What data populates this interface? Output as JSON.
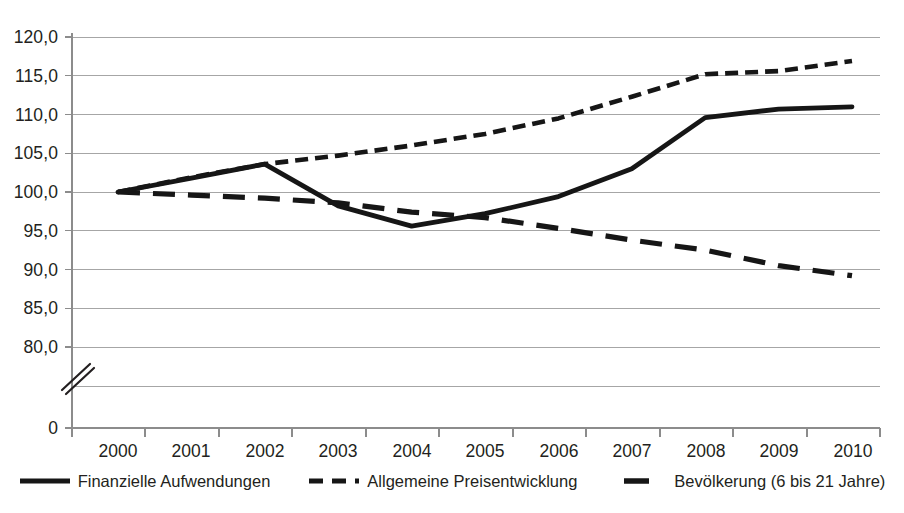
{
  "chart_data": {
    "type": "line",
    "title": "",
    "subtitle": "",
    "xlabel": "",
    "ylabel": "",
    "categories": [
      "2000",
      "2001",
      "2002",
      "2003",
      "2004",
      "2005",
      "2006",
      "2007",
      "2008",
      "2009",
      "2010"
    ],
    "ytick_labels": [
      "120,0",
      "115,0",
      "110,0",
      "105,0",
      "100,0",
      "95,0",
      "90,0",
      "85,0",
      "80,0",
      "0"
    ],
    "ytick_values": [
      120.0,
      115.0,
      110.0,
      105.0,
      100.0,
      95.0,
      90.0,
      85.0,
      80.0,
      0
    ],
    "ylim": [
      80.0,
      120.0
    ],
    "y_axis_break": true,
    "y_axis_break_symbol": "//",
    "grid": "horizontal",
    "legend_position": "bottom",
    "series": [
      {
        "name": "Finanzielle Aufwendungen",
        "style": "solid",
        "color": "#161616",
        "values": [
          100.0,
          101.8,
          103.6,
          98.2,
          95.6,
          97.2,
          99.4,
          103.0,
          109.6,
          110.7,
          111.0
        ]
      },
      {
        "name": "Allgemeine Preisentwicklung",
        "style": "dashed-fine",
        "color": "#161616",
        "values": [
          100.0,
          101.9,
          103.6,
          104.7,
          106.0,
          107.5,
          109.5,
          112.3,
          115.2,
          115.6,
          116.9
        ]
      },
      {
        "name": "Bevölkerung (6 bis 21 Jahre)",
        "style": "dashed-coarse",
        "color": "#161616",
        "values": [
          100.0,
          99.6,
          99.2,
          98.6,
          97.4,
          96.7,
          95.3,
          93.8,
          92.5,
          90.5,
          89.2
        ]
      }
    ]
  },
  "legend": {
    "items": [
      {
        "label": "Finanzielle Aufwendungen",
        "key": "solid-line-key"
      },
      {
        "label": "Allgemeine Preisentwicklung",
        "key": "fine-dash-line-key"
      },
      {
        "label": "Bevölkerung (6 bis 21 Jahre)",
        "key": "coarse-dash-line-key"
      }
    ]
  },
  "axis": {
    "zero_label": "0"
  },
  "colors": {
    "ink": "#231f20",
    "line": "#161616",
    "grid": "#a6a6a6",
    "axis": "#8c8c8c",
    "background": "#ffffff"
  }
}
